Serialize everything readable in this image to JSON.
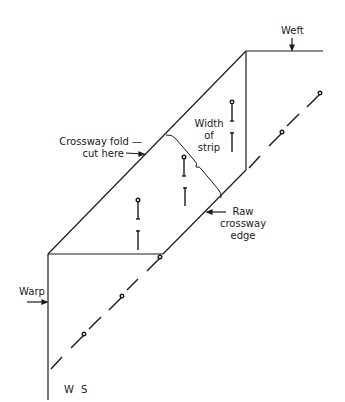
{
  "diagram": {
    "type": "sewing-crossway-strip-cutting",
    "labels": {
      "weft": "Weft",
      "crossway_fold_line1": "Crossway fold —",
      "crossway_fold_line2": "cut here",
      "width_line1": "Width",
      "width_line2": "of",
      "width_line3": "strip",
      "raw_edge_line1": "Raw",
      "raw_edge_line2": "crossway",
      "raw_edge_line3": "edge",
      "warp": "Warp",
      "ws": "W S"
    },
    "icons": [
      "pin-icon",
      "arrow-icon",
      "brace-icon"
    ],
    "colors": {
      "ink": "#1a1a1a",
      "background": "#ffffff"
    }
  }
}
